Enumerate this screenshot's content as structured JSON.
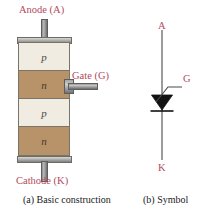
{
  "figure": {
    "background_color": "#ffffff",
    "label_color": "#b34a5e",
    "caption_color": "#1a1a1a"
  },
  "construction": {
    "anode_label": "Anode (A)",
    "cathode_label": "Cathode (K)",
    "gate_label": "Gate (G)",
    "layers": [
      {
        "char": "p",
        "type": "p",
        "color": "#f0ece1"
      },
      {
        "char": "n",
        "type": "n",
        "color": "#b8936a"
      },
      {
        "char": "p",
        "type": "p",
        "color": "#f0ece1"
      },
      {
        "char": "n",
        "type": "n",
        "color": "#b8936a"
      }
    ],
    "lead_color": "#9c9c9c",
    "cap_color": "#a9a9a5"
  },
  "symbol": {
    "anode_label": "A",
    "cathode_label": "K",
    "gate_label": "G",
    "line_color": "#4a4a4a"
  },
  "captions": {
    "a": "(a) Basic construction",
    "b": "(b) Symbol"
  }
}
